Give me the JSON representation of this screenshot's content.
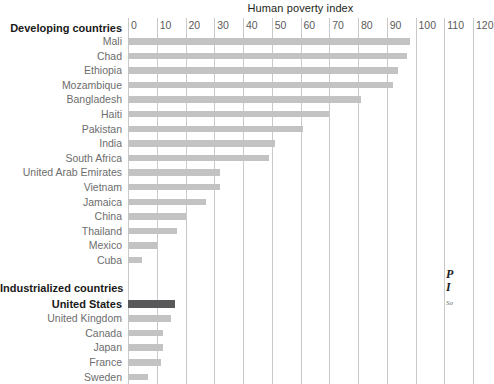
{
  "chart_data": {
    "type": "bar",
    "orientation": "horizontal",
    "title": "Human poverty index",
    "xlabel": "",
    "ylabel": "",
    "xlim": [
      0,
      120
    ],
    "xticks": [
      0,
      10,
      20,
      30,
      40,
      50,
      60,
      70,
      80,
      90,
      100,
      110,
      120
    ],
    "grid": true,
    "legend": "none",
    "groups": [
      {
        "name": "Developing countries",
        "categories": [
          "Mali",
          "Chad",
          "Ethiopia",
          "Mozambique",
          "Bangladesh",
          "Haiti",
          "Pakistan",
          "India",
          "South Africa",
          "United Arab Emirates",
          "Vietnam",
          "Jamaica",
          "China",
          "Thailand",
          "Mexico",
          "Cuba"
        ],
        "values": [
          98,
          97,
          94,
          92,
          81,
          70,
          61,
          51,
          49,
          32,
          32,
          27,
          20,
          17,
          10,
          5
        ]
      },
      {
        "name": "Industrialized countries",
        "categories": [
          "United States",
          "United Kingdom",
          "Canada",
          "Japan",
          "France",
          "Sweden"
        ],
        "values": [
          16.5,
          15,
          12,
          12,
          11.5,
          7
        ],
        "highlight": "United States"
      }
    ],
    "colors": {
      "bar": "#c3c3c3",
      "bar_highlight": "#58585a",
      "gridline": "#c9c9c9",
      "label_text": "#6d6d6d",
      "heading_text": "#1a1a1a"
    }
  },
  "header": {
    "title": "Human poverty index"
  },
  "groups": {
    "developing_label": "Developing countries",
    "industrialized_label": "Industrialized countries"
  },
  "footer": {
    "line1": "P",
    "line2": "I",
    "source": "So"
  }
}
